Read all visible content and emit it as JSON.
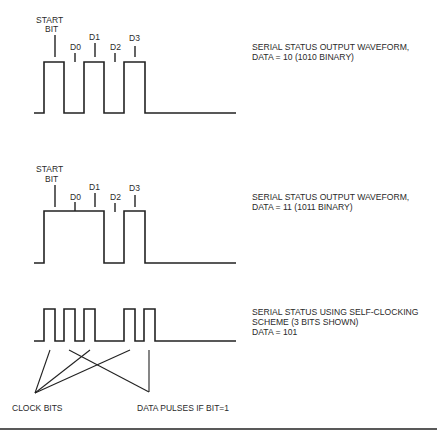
{
  "diagram": {
    "waveforms": [
      {
        "id": "wave1",
        "caption": [
          "SERIAL STATUS OUTPUT WAVEFORM,",
          "DATA = 10 (1010 BINARY)"
        ],
        "labels": {
          "start_line1": "START",
          "start_line2": "BIT",
          "d0": "D0",
          "d1": "D1",
          "d2": "D2",
          "d3": "D3"
        },
        "bits": {
          "start": 1,
          "D0": 0,
          "D1": 1,
          "D2": 0,
          "D3": 1
        }
      },
      {
        "id": "wave2",
        "caption": [
          "SERIAL STATUS OUTPUT WAVEFORM,",
          "DATA = 11 (1011 BINARY)"
        ],
        "labels": {
          "start_line1": "START",
          "start_line2": "BIT",
          "d0": "D0",
          "d1": "D1",
          "d2": "D2",
          "d3": "D3"
        },
        "bits": {
          "start": 1,
          "D0": 1,
          "D1": 1,
          "D2": 0,
          "D3": 1
        }
      },
      {
        "id": "wave3",
        "caption": [
          "SERIAL STATUS USING SELF-CLOCKING",
          "SCHEME (3 BITS SHOWN)",
          "DATA = 101"
        ],
        "annotations": {
          "clock_bits": "CLOCK BITS",
          "data_pulses": "DATA PULSES IF BIT=1"
        },
        "bits": [
          1,
          0,
          1
        ]
      }
    ],
    "colors": {
      "line": "#222222",
      "text": "#2a2a2a",
      "background": "#ffffff"
    }
  }
}
